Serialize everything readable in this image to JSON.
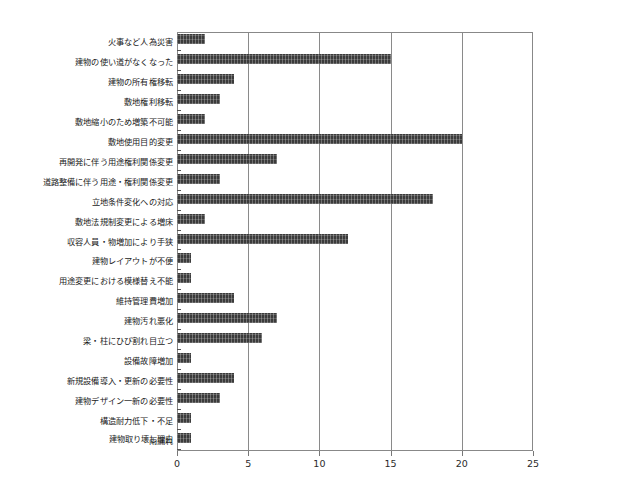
{
  "chart_data": {
    "type": "bar",
    "orientation": "horizontal",
    "title": "",
    "xlabel": "",
    "ylabel": "建物取り壊し理由",
    "xlim": [
      0,
      25
    ],
    "xticks": [
      0,
      5,
      10,
      15,
      20,
      25
    ],
    "grid": true,
    "legend": "none",
    "bar_color": "#3b3b3b",
    "categories": [
      "火事など人為災害",
      "建物の使い道がなくなった",
      "建物の所有権移転",
      "敷地権利移転",
      "敷地縮小のため増築不可能",
      "敷地使用目的変更",
      "再開発に伴う用途権利関係変更",
      "道路整備に伴う用途・権利関係変更",
      "立地条件変化への対応",
      "敷地法規制変更による増床",
      "収容人員・物増加により手狭",
      "建物レイアウトが不便",
      "用途変更における模様替え不能",
      "維持管理費増加",
      "建物汚れ悪化",
      "梁・柱にひび割れ目立つ",
      "設備故障増加",
      "新規設備導入・更新の必要性",
      "建物デザイン一新の必要性",
      "構造耐力低下・不足",
      "雨漏れ"
    ],
    "values": [
      2,
      15,
      4,
      3,
      2,
      20,
      7,
      3,
      18,
      2,
      12,
      1,
      1,
      4,
      7,
      6,
      1,
      4,
      3,
      1,
      1
    ]
  }
}
